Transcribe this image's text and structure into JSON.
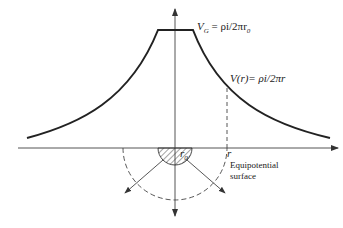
{
  "diagram": {
    "labels": {
      "vg_main": "V",
      "vg_sub": "G",
      "vg_expr": " = ρi/2πr",
      "vg_expr_sub": "0",
      "vr_expr": "V(r)= ρi/2πr",
      "r0_main": "r",
      "r0_sub": "0",
      "r_label": "r",
      "equipotential_line1": "Equipotential",
      "equipotential_line2": "surface"
    },
    "colors": {
      "line": "#222222",
      "axis": "#555555",
      "background": "#ffffff"
    },
    "geometry": {
      "origin": [
        175,
        148
      ],
      "plateau_y": 30,
      "electrode_radius": 17,
      "equipotential_radius": 52
    }
  }
}
